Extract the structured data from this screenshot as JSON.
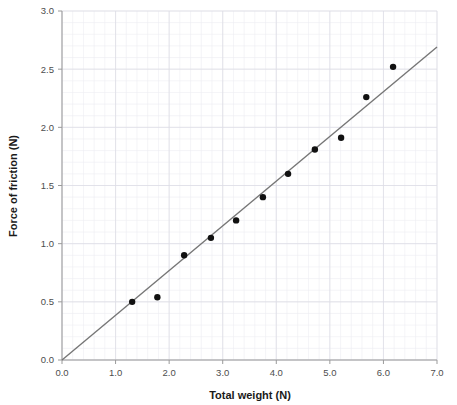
{
  "chart_data": {
    "type": "scatter",
    "title": "",
    "xlabel": "Total weight (N)",
    "ylabel": "Force of friction (N)",
    "xlim": [
      0.0,
      7.0
    ],
    "ylim": [
      0.0,
      3.0
    ],
    "xticks": [
      "0.0",
      "1.0",
      "2.0",
      "3.0",
      "4.0",
      "5.0",
      "6.0",
      "7.0"
    ],
    "xtick_values": [
      0.0,
      1.0,
      2.0,
      3.0,
      4.0,
      5.0,
      6.0,
      7.0
    ],
    "yticks": [
      "0.0",
      "0.5",
      "1.0",
      "1.5",
      "2.0",
      "2.5",
      "3.0"
    ],
    "ytick_values": [
      0.0,
      0.5,
      1.0,
      1.5,
      2.0,
      2.5,
      3.0
    ],
    "grid": true,
    "grid_minor_step_x": 0.2,
    "grid_minor_step_y": 0.1,
    "legend": null,
    "x": [
      1.31,
      1.78,
      2.28,
      2.78,
      3.25,
      3.75,
      4.22,
      4.72,
      5.21,
      5.68,
      6.18
    ],
    "y": [
      0.5,
      0.54,
      0.9,
      1.05,
      1.2,
      1.4,
      1.6,
      1.81,
      1.91,
      2.26,
      2.52
    ],
    "points": [
      {
        "x": 1.31,
        "y": 0.5
      },
      {
        "x": 1.78,
        "y": 0.54
      },
      {
        "x": 2.28,
        "y": 0.9
      },
      {
        "x": 2.78,
        "y": 1.05
      },
      {
        "x": 3.25,
        "y": 1.2
      },
      {
        "x": 3.75,
        "y": 1.4
      },
      {
        "x": 4.22,
        "y": 1.6
      },
      {
        "x": 4.72,
        "y": 1.81
      },
      {
        "x": 5.21,
        "y": 1.91
      },
      {
        "x": 5.68,
        "y": 2.26
      },
      {
        "x": 6.18,
        "y": 2.52
      }
    ],
    "marker_size": 3.2,
    "marker_color": "#111111",
    "trendline": {
      "type": "line",
      "x0": 0.0,
      "y0": 0.0,
      "x1": 7.0,
      "y1": 2.69,
      "slope": 0.3843,
      "intercept": 0.0,
      "color": "#767676"
    },
    "colors": {
      "background": "#ffffff",
      "grid_minor": "#ececf2",
      "grid_major": "#dddde6",
      "axis": "#9a9a9a",
      "text": "#1a1a1a",
      "tick_text": "#4d4d4d"
    }
  },
  "layout": {
    "plot_left_px": 62,
    "plot_right_px": 437,
    "plot_top_px": 11,
    "plot_bottom_px": 360
  }
}
